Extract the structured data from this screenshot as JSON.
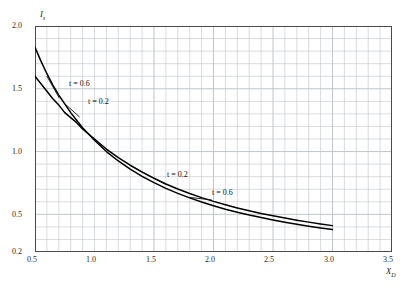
{
  "chart_data": {
    "type": "line",
    "title": "",
    "xlabel": "X_D",
    "ylabel": "I_s",
    "xlim": [
      0.5,
      3.5
    ],
    "ylim": [
      0.2,
      2.0
    ],
    "xticks": [
      "0.5",
      "1.0",
      "1.5",
      "2.0",
      "2.5",
      "3.0",
      "3.5"
    ],
    "xtick_values": [
      0.5,
      1.0,
      1.5,
      2.0,
      2.5,
      3.0,
      3.5
    ],
    "yticks": [
      "0.2",
      "0.5",
      "1.0",
      "1.5",
      "2.0"
    ],
    "ytick_values": [
      0.2,
      0.5,
      1.0,
      1.5,
      2.0
    ],
    "grid": true,
    "grid_minor_x_step": 0.1,
    "grid_minor_y_step": 0.1,
    "legend": "inline-annotations",
    "series": [
      {
        "name": "t = 0.6",
        "label_upper": "t = 0.6",
        "label_lower": "t = 0.6",
        "x": [
          0.5,
          0.55,
          0.6,
          0.65,
          0.7,
          0.75,
          0.8,
          0.85,
          0.9,
          1.0,
          1.1,
          1.2,
          1.3,
          1.4,
          1.5,
          1.6,
          1.7,
          1.8,
          1.9,
          2.0,
          2.1,
          2.2,
          2.3,
          2.4,
          2.5,
          2.6,
          2.7,
          2.8,
          2.9,
          3.0
        ],
        "y": [
          1.83,
          1.72,
          1.62,
          1.53,
          1.45,
          1.38,
          1.31,
          1.25,
          1.19,
          1.09,
          1.0,
          0.925,
          0.86,
          0.803,
          0.752,
          0.707,
          0.667,
          0.631,
          0.598,
          0.568,
          0.541,
          0.517,
          0.494,
          0.474,
          0.455,
          0.437,
          0.421,
          0.406,
          0.392,
          0.379
        ]
      },
      {
        "name": "t = 0.2",
        "label_upper": "t = 0.2",
        "label_lower": "t = 0.2",
        "x": [
          0.5,
          0.55,
          0.6,
          0.65,
          0.7,
          0.75,
          0.8,
          0.85,
          0.9,
          1.0,
          1.1,
          1.2,
          1.3,
          1.4,
          1.5,
          1.6,
          1.7,
          1.8,
          1.9,
          2.0,
          2.1,
          2.2,
          2.3,
          2.4,
          2.5,
          2.6,
          2.7,
          2.8,
          2.9,
          3.0
        ],
        "y": [
          1.6,
          1.54,
          1.48,
          1.42,
          1.37,
          1.31,
          1.27,
          1.23,
          1.18,
          1.1,
          1.02,
          0.952,
          0.891,
          0.836,
          0.787,
          0.742,
          0.702,
          0.666,
          0.633,
          0.603,
          0.576,
          0.551,
          0.528,
          0.507,
          0.488,
          0.47,
          0.453,
          0.438,
          0.423,
          0.41
        ]
      }
    ],
    "annotations": [
      {
        "text": "t = 0.6",
        "target_series": "t = 0.6",
        "region": "upper-left",
        "x": 0.72,
        "y": 1.44
      },
      {
        "text": "t = 0.2",
        "target_series": "t = 0.2",
        "region": "upper-left",
        "x": 0.88,
        "y": 1.29
      },
      {
        "text": "t = 0.2",
        "target_series": "t = 0.2",
        "region": "mid-right",
        "x": 1.62,
        "y": 0.7
      },
      {
        "text": "t = 0.6",
        "target_series": "t = 0.6",
        "region": "mid-right",
        "x": 2.0,
        "y": 0.58
      }
    ],
    "colors": {
      "curve": "#000000",
      "grid": "#b9bfc4",
      "frame": "#4a4a4a",
      "text": "#1a1a1a"
    }
  },
  "axis_titles": {
    "y_main": "I",
    "y_sub": "s",
    "x_main": "X",
    "x_sub": "D"
  },
  "labels": {
    "t06_upper": "t = 0.6",
    "t02_upper": "t = 0.2",
    "t02_lower": "t = 0.2",
    "t06_lower": "t = 0.6"
  },
  "xticks_render": [
    {
      "text": "0.5",
      "left": 27,
      "top": 255
    },
    {
      "text": "1.0",
      "left": 86,
      "top": 255
    },
    {
      "text": "1.5",
      "left": 146,
      "top": 255
    },
    {
      "text": "2.0",
      "left": 205,
      "top": 255
    },
    {
      "text": "2.5",
      "left": 264,
      "top": 255
    },
    {
      "text": "3.0",
      "left": 324,
      "top": 255
    },
    {
      "text": "3.5",
      "left": 383,
      "top": 255
    }
  ],
  "yticks_render": [
    {
      "text": "2.0",
      "left": 12,
      "top": 21
    },
    {
      "text": "1.5",
      "left": 12,
      "top": 84
    },
    {
      "text": "1.0",
      "left": 12,
      "top": 147
    },
    {
      "text": "0.5",
      "left": 12,
      "top": 210
    },
    {
      "text": "0.2",
      "left": 12,
      "top": 247
    }
  ]
}
